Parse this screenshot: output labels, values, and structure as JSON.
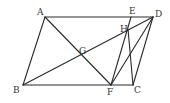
{
  "diagram": {
    "type": "geometry",
    "stroke_color": "#2a2a2a",
    "label_color": "#333333",
    "points": {
      "A": {
        "label": "A",
        "x": 45,
        "y": 17
      },
      "B": {
        "label": "B",
        "x": 23,
        "y": 85
      },
      "C": {
        "label": "C",
        "x": 133,
        "y": 85
      },
      "D": {
        "label": "D",
        "x": 153,
        "y": 17
      },
      "E": {
        "label": "E",
        "x": 131,
        "y": 17
      },
      "F": {
        "label": "F",
        "x": 111,
        "y": 85
      },
      "G": {
        "label": "G",
        "x": 82,
        "y": 55
      },
      "H": {
        "label": "H",
        "x": 128,
        "y": 29
      }
    },
    "segments": [
      [
        "A",
        "D"
      ],
      [
        "B",
        "C"
      ],
      [
        "A",
        "B"
      ],
      [
        "D",
        "C"
      ],
      [
        "A",
        "F"
      ],
      [
        "B",
        "D"
      ],
      [
        "E",
        "F"
      ],
      [
        "H",
        "C"
      ],
      [
        "D",
        "F"
      ]
    ]
  }
}
